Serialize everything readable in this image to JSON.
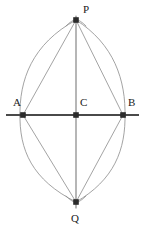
{
  "figure": {
    "width": 144,
    "height": 232,
    "background_color": "#ffffff",
    "stroke_colors": {
      "baseline": "#4a4a4a",
      "vertical": "#7a7a7a",
      "arc": "#8c8c8c",
      "chord": "#8c8c8c",
      "point": "#2b2b2b",
      "label": "#1a1a1a"
    },
    "points": [
      {
        "id": "P",
        "label": "P",
        "x": 76,
        "y": 20,
        "label_x": 83,
        "label_y": 13,
        "marker": "square-dot-with-cross"
      },
      {
        "id": "A",
        "label": "A",
        "x": 23,
        "y": 115,
        "label_x": 13,
        "label_y": 106,
        "marker": "square-dot"
      },
      {
        "id": "C",
        "label": "C",
        "x": 76,
        "y": 115,
        "label_x": 80,
        "label_y": 106,
        "marker": "square-dot"
      },
      {
        "id": "B",
        "label": "B",
        "x": 123,
        "y": 115,
        "label_x": 128,
        "label_y": 106,
        "marker": "square-dot"
      },
      {
        "id": "Q",
        "label": "Q",
        "x": 76,
        "y": 202,
        "label_x": 71,
        "label_y": 222,
        "marker": "square-dot-with-cross"
      }
    ],
    "segments": [
      {
        "id": "baseline-AB",
        "label": "line AB",
        "x1": 6,
        "y1": 115,
        "x2": 139,
        "y2": 115,
        "width": 2.2,
        "kind": "baseline"
      },
      {
        "id": "vertical-PQ",
        "label": "line PQ",
        "x1": 76,
        "y1": 16,
        "x2": 76,
        "y2": 208,
        "width": 1.1,
        "kind": "vertical"
      },
      {
        "id": "chord-AP",
        "label": "segment AP",
        "x1": 23,
        "y1": 115,
        "x2": 76,
        "y2": 20,
        "width": 0.8,
        "kind": "chord"
      },
      {
        "id": "chord-PB",
        "label": "segment PB",
        "x1": 76,
        "y1": 20,
        "x2": 123,
        "y2": 115,
        "width": 0.8,
        "kind": "chord"
      },
      {
        "id": "chord-AQ",
        "label": "segment AQ",
        "x1": 23,
        "y1": 115,
        "x2": 76,
        "y2": 202,
        "width": 0.8,
        "kind": "chord"
      },
      {
        "id": "chord-QB",
        "label": "segment QB",
        "x1": 76,
        "y1": 202,
        "x2": 123,
        "y2": 115,
        "width": 0.8,
        "kind": "chord"
      }
    ],
    "arcs": [
      {
        "id": "arc-center-A-upper",
        "label": "arc centered at A through P",
        "d": "M 76 20 C 32 44 19 80 20 117",
        "width": 0.8
      },
      {
        "id": "arc-center-A-lower",
        "label": "arc centered at A through Q",
        "d": "M 20 113 C 19 150 32 180 76 202",
        "width": 0.8
      },
      {
        "id": "arc-center-B-upper",
        "label": "arc centered at B through P",
        "d": "M 76 20 C 114 44 126 80 125 117",
        "width": 0.8
      },
      {
        "id": "arc-center-B-lower",
        "label": "arc centered at B through Q",
        "d": "M 125 113 C 126 150 114 180 76 202",
        "width": 0.8
      },
      {
        "id": "arc-tick-P-left",
        "label": "arc tick near P left",
        "d": "M 66 26 C 70 22 73 20 77 19",
        "width": 0.8
      },
      {
        "id": "arc-tick-P-right",
        "label": "arc tick near P right",
        "d": "M 86 26 C 82 22 79 20 75 19",
        "width": 0.8
      },
      {
        "id": "arc-tick-Q-left",
        "label": "arc tick near Q left",
        "d": "M 66 196 C 70 200 73 202 77 203",
        "width": 0.8
      },
      {
        "id": "arc-tick-Q-right",
        "label": "arc tick near Q right",
        "d": "M 86 196 C 82 200 79 202 75 203",
        "width": 0.8
      }
    ]
  }
}
